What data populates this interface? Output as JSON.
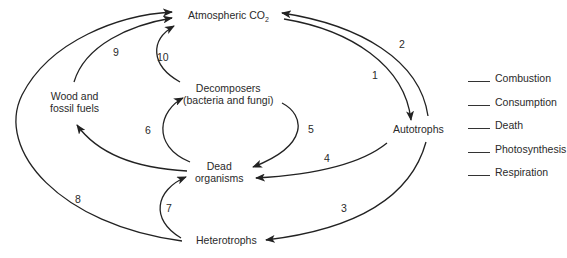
{
  "diagram": {
    "nodes": {
      "atmospheric_co2": "Atmospheric CO",
      "atmospheric_co2_sub": "2",
      "autotrophs": "Autotrophs",
      "heterotrophs": "Heterotrophs",
      "dead_organisms_line1": "Dead",
      "dead_organisms_line2": "organisms",
      "decomposers_line1": "Decomposers",
      "decomposers_line2": "(bacteria and fungi)",
      "wood_line1": "Wood and",
      "wood_line2": "fossil fuels"
    },
    "arrow_numbers": {
      "n1": "1",
      "n2": "2",
      "n3": "3",
      "n4": "4",
      "n5": "5",
      "n6": "6",
      "n7": "7",
      "n8": "8",
      "n9": "9",
      "n10": "10"
    },
    "arrows": [
      {
        "number": "1",
        "from": "Atmospheric CO2",
        "to": "Autotrophs"
      },
      {
        "number": "2",
        "from": "Autotrophs",
        "to": "Atmospheric CO2"
      },
      {
        "number": "3",
        "from": "Autotrophs",
        "to": "Heterotrophs"
      },
      {
        "number": "4",
        "from": "Autotrophs",
        "to": "Dead organisms"
      },
      {
        "number": "5",
        "from": "Decomposers",
        "to": "Dead organisms"
      },
      {
        "number": "6",
        "from": "Dead organisms",
        "to": "Decomposers"
      },
      {
        "number": "",
        "from": "Dead organisms",
        "to": "Wood and fossil fuels"
      },
      {
        "number": "7",
        "from": "Heterotrophs",
        "to": "Dead organisms"
      },
      {
        "number": "8",
        "from": "Heterotrophs",
        "to": "Atmospheric CO2"
      },
      {
        "number": "9",
        "from": "Wood and fossil fuels",
        "to": "Atmospheric CO2"
      },
      {
        "number": "10",
        "from": "Decomposers",
        "to": "Atmospheric CO2"
      }
    ],
    "legend": {
      "items": [
        "Combustion",
        "Consumption",
        "Death",
        "Photosynthesis",
        "Respiration"
      ]
    },
    "colors": {
      "ink": "#2a2a2a",
      "background": "#ffffff"
    }
  }
}
